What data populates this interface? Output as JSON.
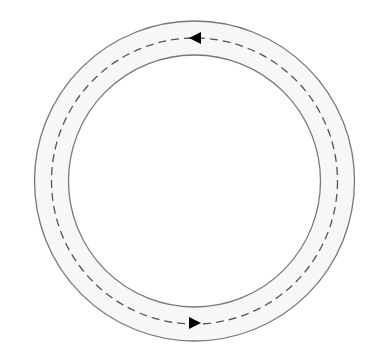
{
  "diagram": {
    "type": "circular-track",
    "center": [
      194.5,
      181
    ],
    "outer_radius": 160,
    "inner_radius": 126,
    "path_radius": 143,
    "colors": {
      "background": "#ffffff",
      "ring_fill": "#f7f7f7",
      "ring_stroke": "#777777",
      "path_stroke": "#555555",
      "arrow": "#000000"
    },
    "arrows": [
      {
        "position": "top",
        "direction": "left"
      },
      {
        "position": "bottom",
        "direction": "right"
      }
    ],
    "flow": "counter-clockwise"
  }
}
